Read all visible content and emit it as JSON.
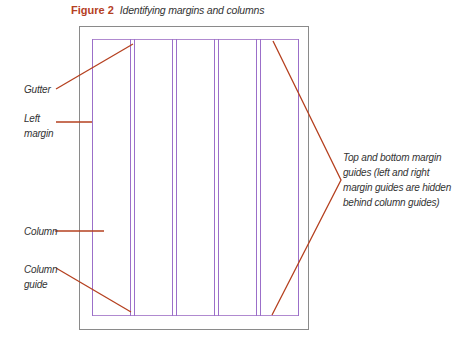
{
  "figure": {
    "number": "Figure 2",
    "title": "Identifying margins and columns"
  },
  "labels": {
    "gutter": "Gutter",
    "left_margin_line1": "Left",
    "left_margin_line2": "margin",
    "column": "Column",
    "column_guide_line1": "Column",
    "column_guide_line2": "guide",
    "margin_guides_line1": "Top and bottom margin",
    "margin_guides_line2": "guides (left and right",
    "margin_guides_line3": "margin guides are hidden",
    "margin_guides_line4": "behind column guides)"
  },
  "colors": {
    "accent_number": "#b5401f",
    "callout_line": "#b5401f",
    "guide": "#9b6fc9",
    "page_border": "#8a8a8a"
  }
}
